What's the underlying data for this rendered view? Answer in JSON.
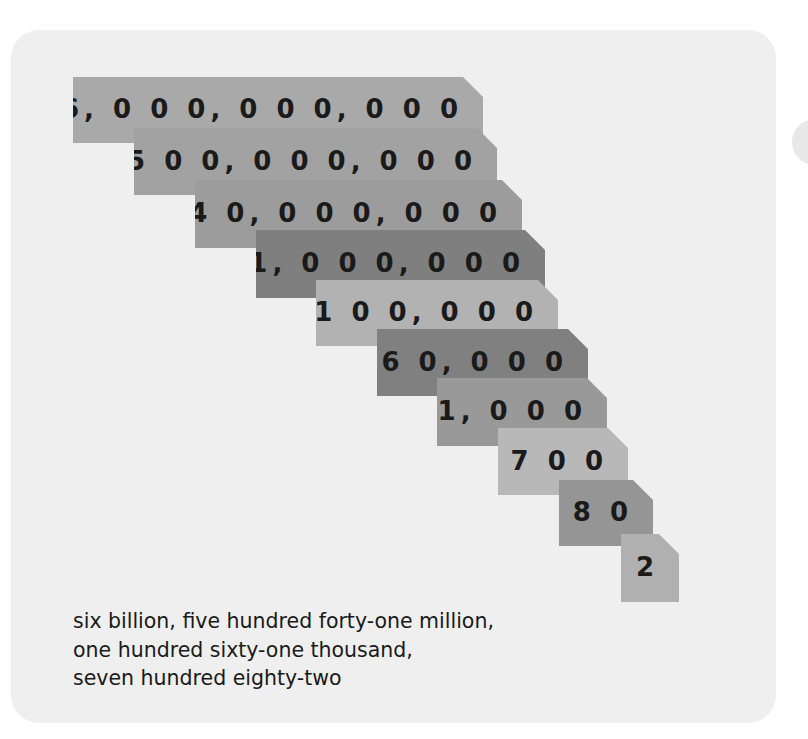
{
  "diagram": {
    "bars": [
      {
        "label": "6, 0 0 0, 0 0 0, 0 0 0",
        "value": 6000000000,
        "color": "#a9a9a9",
        "x": 73,
        "y": 77,
        "w": 410,
        "h": 66
      },
      {
        "label": "5 0 0, 0 0 0, 0 0 0",
        "value": 500000000,
        "color": "#a2a2a2",
        "x": 134,
        "y": 128,
        "w": 363,
        "h": 67
      },
      {
        "label": "4 0, 0 0 0, 0 0 0",
        "value": 40000000,
        "color": "#9c9c9c",
        "x": 195,
        "y": 180,
        "w": 327,
        "h": 68
      },
      {
        "label": "1, 0 0 0, 0 0 0",
        "value": 1000000,
        "color": "#7f7f7f",
        "x": 256,
        "y": 230,
        "w": 289,
        "h": 68
      },
      {
        "label": "1 0 0, 0 0 0",
        "value": 100000,
        "color": "#b2b2b2",
        "x": 316,
        "y": 280,
        "w": 242,
        "h": 66
      },
      {
        "label": "6 0, 0 0 0",
        "value": 60000,
        "color": "#808080",
        "x": 377,
        "y": 329,
        "w": 211,
        "h": 67
      },
      {
        "label": "1, 0 0 0",
        "value": 1000,
        "color": "#999999",
        "x": 437,
        "y": 378,
        "w": 170,
        "h": 68
      },
      {
        "label": "7 0 0",
        "value": 700,
        "color": "#b8b8b8",
        "x": 498,
        "y": 428,
        "w": 130,
        "h": 67
      },
      {
        "label": "8 0",
        "value": 80,
        "color": "#959595",
        "x": 559,
        "y": 480,
        "w": 94,
        "h": 66
      },
      {
        "label": "2",
        "value": 2,
        "color": "#b0b0b0",
        "x": 621,
        "y": 534,
        "w": 58,
        "h": 68
      }
    ],
    "caption": {
      "lines": [
        "six billion, five hundred forty-one million,",
        "one hundred sixty-one thousand,",
        "seven hundred eighty-two"
      ]
    },
    "colors": {
      "card_background": "#efefef",
      "page_background": "#ffffff",
      "text": "#1a1a1a"
    }
  }
}
